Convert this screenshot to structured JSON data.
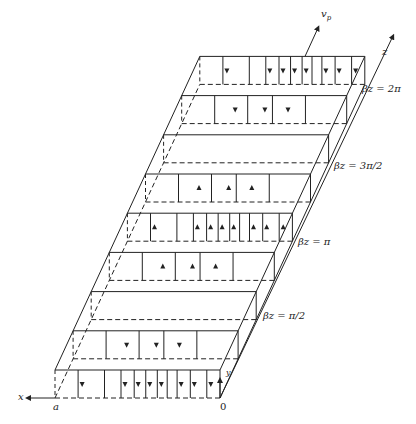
{
  "diagram": {
    "type": "waveguide-field-pattern",
    "colors": {
      "line": "#222222",
      "background": "#ffffff"
    },
    "axes": {
      "x_label": "x",
      "y_label": "y",
      "z_label": "z",
      "vp_label": "v",
      "vp_subscript": "p",
      "origin_label": "0",
      "a_label": "a"
    },
    "phase_labels": [
      {
        "id": "two-pi",
        "text": "βz = 2π"
      },
      {
        "id": "three-pi-half",
        "text": "βz = 3π/2"
      },
      {
        "id": "pi",
        "text": "βz = π"
      },
      {
        "id": "pi-half",
        "text": "βz = π/2"
      }
    ],
    "slabs": [
      {
        "index": 0,
        "direction": "down",
        "field": "strong"
      },
      {
        "index": 1,
        "direction": "down",
        "field": "medium"
      },
      {
        "index": 2,
        "direction": "none",
        "field": "zero"
      },
      {
        "index": 3,
        "direction": "up",
        "field": "medium"
      },
      {
        "index": 4,
        "direction": "up",
        "field": "strong"
      },
      {
        "index": 5,
        "direction": "up",
        "field": "medium"
      },
      {
        "index": 6,
        "direction": "none",
        "field": "zero"
      },
      {
        "index": 7,
        "direction": "down",
        "field": "medium"
      },
      {
        "index": 8,
        "direction": "down",
        "field": "strong"
      }
    ]
  }
}
